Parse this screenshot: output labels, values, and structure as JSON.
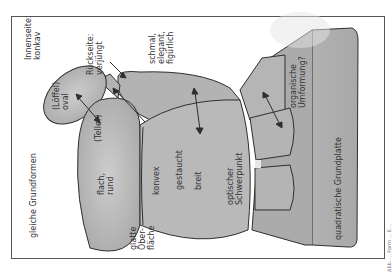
{
  "diagram": {
    "labels": {
      "innenseite": "Innenseite:\nkonkav",
      "rueckseite": "Rückseite:\nverjüngt",
      "schmal": "schmal,\nelegant,\nfigürlich",
      "loeffel": "(Löffel)\noval",
      "teller": "(Teller)",
      "flach_rund": "flach,\nrund",
      "gleiche_grundformen": "gleiche Grundformen",
      "glatte_oberflaeche": "glatte\nOber-\nfläche",
      "konvex": "konvex",
      "gestaucht": "gestaucht",
      "breit": "breit",
      "optischer_schwerpunkt": "optischer\nSchwerpunkt",
      "organische_umformung": "organische\nUmformung?",
      "quadratische_grundplatte": "quadratische Grundplatte"
    },
    "caption": "Abb. ... Form ... E...",
    "colors": {
      "sculpture_fill": "#b8b8b8",
      "sculpture_shade": "#a4a4a4",
      "outline": "#2f2f2f",
      "text": "#333333",
      "frame": "#555555"
    }
  }
}
